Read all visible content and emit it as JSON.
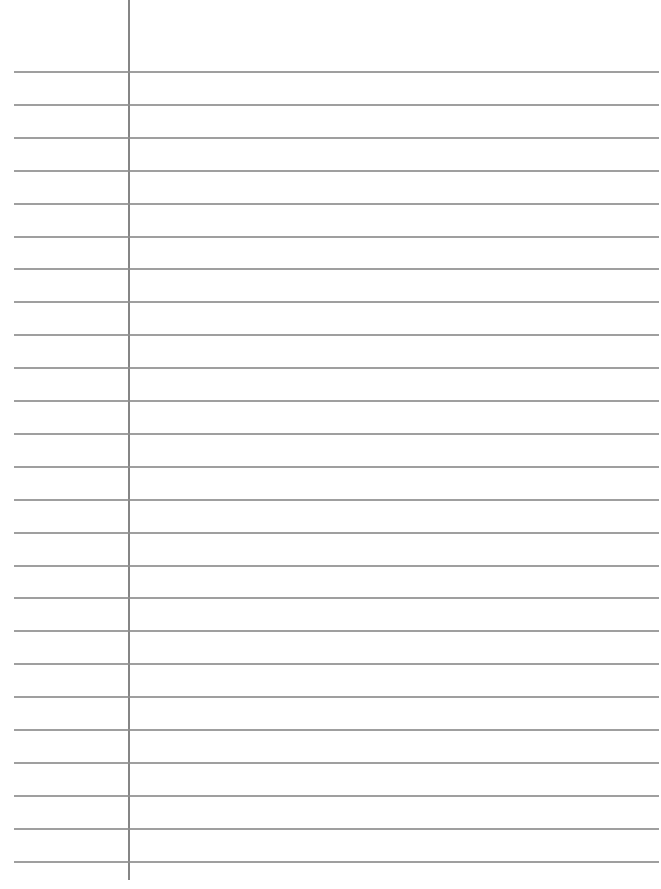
{
  "paper": {
    "type": "lined-notebook-page",
    "line_color": "#8e8e8e",
    "margin_color": "#858585",
    "background": "#ffffff",
    "line_count": 25,
    "first_line_y": 71,
    "line_spacing": 32.9,
    "line_left": 14,
    "line_right": 659,
    "margin_x": 128,
    "margin_bottom": 880
  }
}
